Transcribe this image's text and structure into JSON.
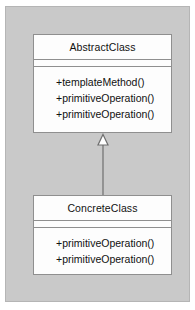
{
  "diagram": {
    "type": "uml-class-diagram",
    "pattern": "Template Method",
    "background_color": "#c9c9c9",
    "box_fill_color": "#fdfdfd",
    "line_color": "#8f8f8f",
    "text_color": "#111111",
    "classes": [
      {
        "id": "abstract-class",
        "name": "AbstractClass",
        "attributes": [],
        "operations": [
          "+templateMethod()",
          "+primitiveOperation()",
          "+primitiveOperation()"
        ]
      },
      {
        "id": "concrete-class",
        "name": "ConcreteClass",
        "attributes": [],
        "operations": [
          "+primitiveOperation()",
          "+primitiveOperation()"
        ]
      }
    ],
    "relationships": [
      {
        "id": "generalization",
        "kind": "generalization",
        "source": "ConcreteClass",
        "target": "AbstractClass",
        "arrowhead": "hollow-triangle",
        "line_style": "solid"
      }
    ]
  }
}
